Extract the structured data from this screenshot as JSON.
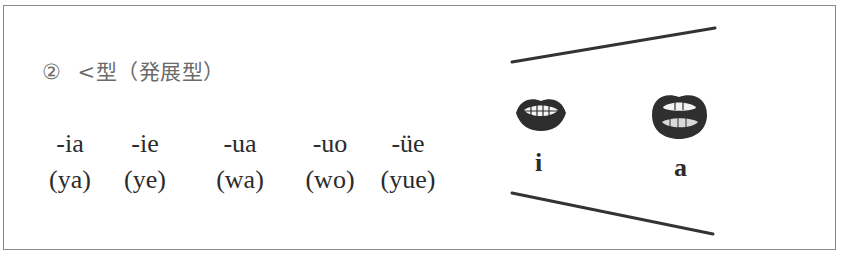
{
  "heading": {
    "number": "②",
    "text": "<型（発展型）"
  },
  "finals": [
    {
      "final": "-ia",
      "spelling": "(ya)"
    },
    {
      "final": "-ie",
      "spelling": "(ye)"
    },
    {
      "final": "-ua",
      "spelling": "(wa)"
    },
    {
      "final": "-uo",
      "spelling": "(wo)"
    },
    {
      "final": "-üe",
      "spelling": "(yue)"
    }
  ],
  "diagram": {
    "mouths": [
      {
        "label": "i",
        "shape": "mouth-spread-icon"
      },
      {
        "label": "a",
        "shape": "mouth-open-icon"
      }
    ],
    "line_color": "#333333"
  }
}
